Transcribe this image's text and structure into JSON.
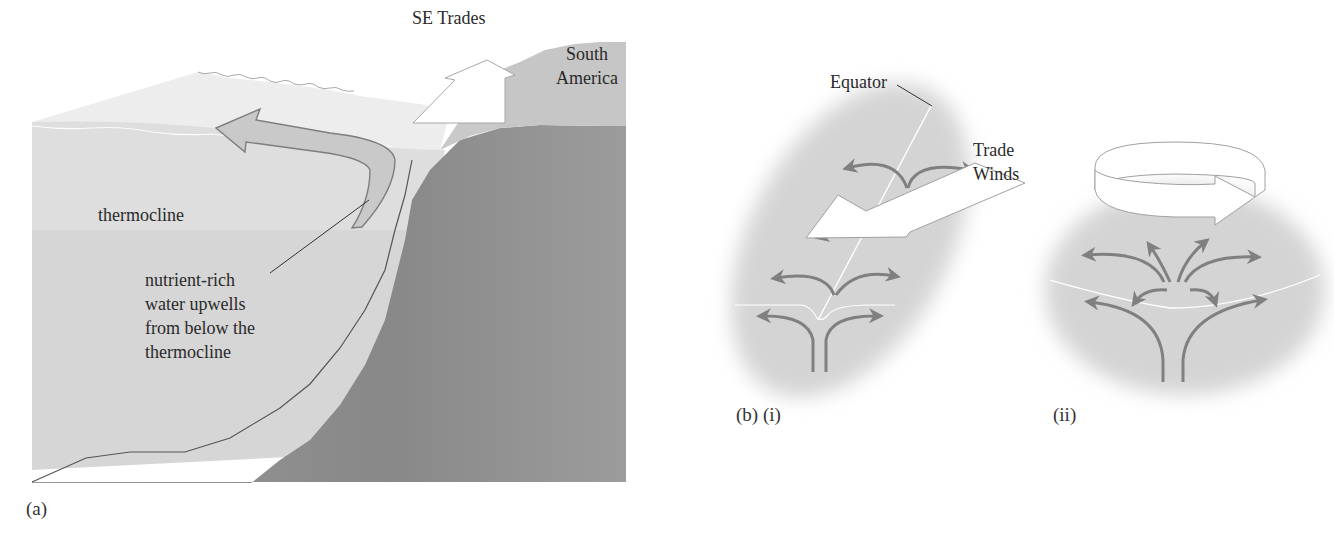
{
  "panel_a": {
    "caption": "(a)",
    "labels": {
      "wind": "SE Trades",
      "land": "South\nAmerica",
      "layer": "thermocline",
      "annotation": "nutrient-rich\nwater upwells\nfrom below the\nthermocline"
    },
    "colors": {
      "surface_water": "#ececec",
      "upper_water": "#dcdcdc",
      "deep_water": "#d2d2d2",
      "land_upper": "#c4c4c4",
      "land_lower": "#8e8e8e",
      "arrow_fill": "#c8c8c8",
      "arrow_stroke": "#7a7a7a"
    }
  },
  "panel_b_i": {
    "caption": "(b) (i)",
    "labels": {
      "line": "Equator",
      "wind": "Trade\nWinds"
    }
  },
  "panel_b_ii": {
    "caption": "(ii)"
  },
  "colors": {
    "flow_arrow": "#808080",
    "halo": "#d6d6d6",
    "background": "#ffffff"
  }
}
